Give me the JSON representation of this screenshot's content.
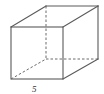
{
  "diagram": {
    "type": "cube",
    "edge_label": "5",
    "edge_color": "#5a5a5a",
    "label_color": "#333333"
  }
}
